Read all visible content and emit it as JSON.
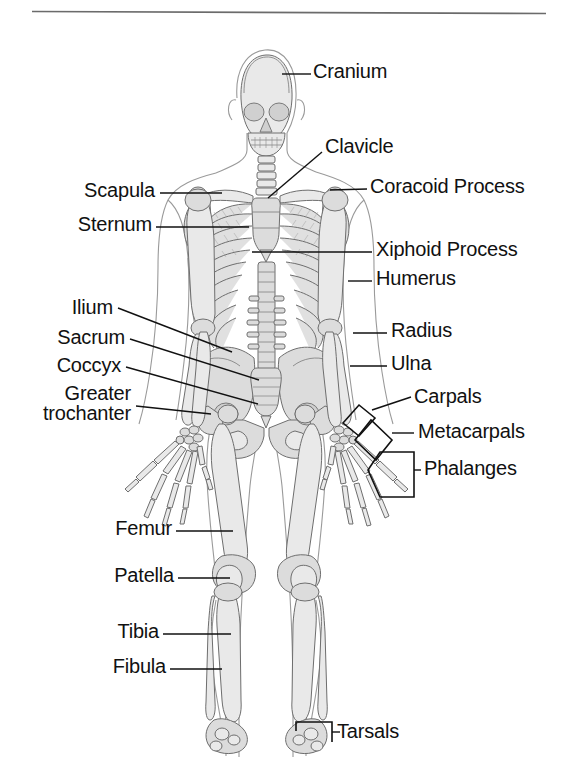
{
  "figure": {
    "rule": {
      "visible": true,
      "x1": 32,
      "x2": 546,
      "y": 11,
      "color": "#6b6b6b"
    },
    "colors": {
      "bone_fill": "#e9e9e9",
      "bone_fill_dark": "#d2d2d2",
      "bone_outline": "#6e6e6e",
      "body_outline": "#8d8d8d",
      "leader_line": "#111111",
      "text": "#111111",
      "background": "#ffffff"
    },
    "labels": [
      {
        "id": "cranium",
        "text": "Cranium",
        "side": "right",
        "x": 316,
        "y": 61,
        "leader": [
          [
            282,
            74
          ],
          [
            311,
            74
          ]
        ]
      },
      {
        "id": "clavicle",
        "text": "Clavicle",
        "side": "right",
        "x": 326,
        "y": 136,
        "leader": [
          [
            268,
            196
          ],
          [
            322,
            152
          ]
        ]
      },
      {
        "id": "coracoid-process",
        "text": "Coracoid Process",
        "side": "right",
        "x": 372,
        "y": 176,
        "leader": [
          [
            330,
            190
          ],
          [
            367,
            189
          ]
        ]
      },
      {
        "id": "xiphoid-process",
        "text": "Xiphoid Process",
        "side": "right",
        "x": 377,
        "y": 239,
        "leader": [
          [
            252,
            251
          ],
          [
            372,
            251
          ]
        ]
      },
      {
        "id": "humerus",
        "text": "Humerus",
        "side": "right",
        "x": 377,
        "y": 268,
        "leader": [
          [
            348,
            280
          ],
          [
            372,
            280
          ]
        ]
      },
      {
        "id": "radius",
        "text": "Radius",
        "side": "right",
        "x": 392,
        "y": 320,
        "leader": [
          [
            355,
            332
          ],
          [
            387,
            332
          ]
        ]
      },
      {
        "id": "ulna",
        "text": "Ulna",
        "side": "right",
        "x": 392,
        "y": 353,
        "leader": [
          [
            352,
            365
          ],
          [
            387,
            365
          ]
        ]
      },
      {
        "id": "carpals",
        "text": "Carpals",
        "side": "right",
        "x": 416,
        "y": 386,
        "leader": [
          [
            378,
            409
          ],
          [
            411,
            398
          ]
        ]
      },
      {
        "id": "metacarpals",
        "text": "Metacarpals",
        "side": "right",
        "x": 419,
        "y": 420,
        "leader": [
          [
            398,
            432
          ],
          [
            414,
            432
          ]
        ]
      },
      {
        "id": "phalanges",
        "text": "Phalanges",
        "side": "right",
        "x": 425,
        "y": 458,
        "leader": [
          [
            406,
            470
          ],
          [
            420,
            470
          ]
        ]
      },
      {
        "id": "tarsals",
        "text": "Tarsals",
        "side": "right",
        "x": 337,
        "y": 735,
        "leader": [
          [
            322,
            731
          ],
          [
            333,
            731
          ]
        ]
      },
      {
        "id": "scapula",
        "text": "Scapula",
        "side": "left",
        "x": 99,
        "y": 180,
        "leader": [
          [
            104,
            192
          ],
          [
            222,
            192
          ]
        ]
      },
      {
        "id": "sternum",
        "text": "Sternum",
        "side": "left",
        "x": 70,
        "y": 214,
        "leader": [
          [
            156,
            226
          ],
          [
            247,
            226
          ]
        ]
      },
      {
        "id": "ilium",
        "text": "Ilium",
        "side": "left",
        "x": 58,
        "y": 297,
        "leader": [
          [
            114,
            308
          ],
          [
            232,
            350
          ]
        ]
      },
      {
        "id": "sacrum",
        "text": "Sacrum",
        "side": "left",
        "x": 53,
        "y": 327,
        "leader": [
          [
            121,
            338
          ],
          [
            259,
            378
          ]
        ]
      },
      {
        "id": "coccyx",
        "text": "Coccyx",
        "side": "left",
        "x": 54,
        "y": 355,
        "leader": [
          [
            121,
            366
          ],
          [
            258,
            402
          ]
        ]
      },
      {
        "id": "greater-trochanter",
        "text": "Greater\ntrochanter",
        "side": "left",
        "x": 33,
        "y": 383,
        "leader": [
          [
            130,
            405
          ],
          [
            211,
            413
          ]
        ]
      },
      {
        "id": "femur",
        "text": "Femur",
        "side": "left",
        "x": 110,
        "y": 518,
        "leader": [
          [
            176,
            530
          ],
          [
            231,
            530
          ]
        ]
      },
      {
        "id": "patella",
        "text": "Patella",
        "side": "left",
        "x": 104,
        "y": 565,
        "leader": [
          [
            180,
            577
          ],
          [
            228,
            577
          ]
        ]
      },
      {
        "id": "tibia",
        "text": "Tibia",
        "side": "left",
        "x": 112,
        "y": 621,
        "leader": [
          [
            163,
            633
          ],
          [
            229,
            633
          ]
        ]
      },
      {
        "id": "fibula",
        "text": "Fibula",
        "side": "left",
        "x": 106,
        "y": 656,
        "leader": [
          [
            172,
            668
          ],
          [
            224,
            668
          ]
        ]
      }
    ],
    "bracket_labels": [
      "carpals",
      "metacarpals",
      "phalanges",
      "tarsals"
    ],
    "bone_groups": [
      "cranium",
      "mandible",
      "cervical-vertebrae",
      "clavicle",
      "scapula",
      "sternum",
      "ribs",
      "thoracic-vertebrae",
      "lumbar-vertebrae",
      "humerus",
      "radius",
      "ulna",
      "carpals",
      "metacarpals",
      "phalanges",
      "ilium",
      "sacrum",
      "coccyx",
      "pubis",
      "femur",
      "patella",
      "tibia",
      "fibula",
      "tarsals",
      "metatarsals"
    ]
  }
}
